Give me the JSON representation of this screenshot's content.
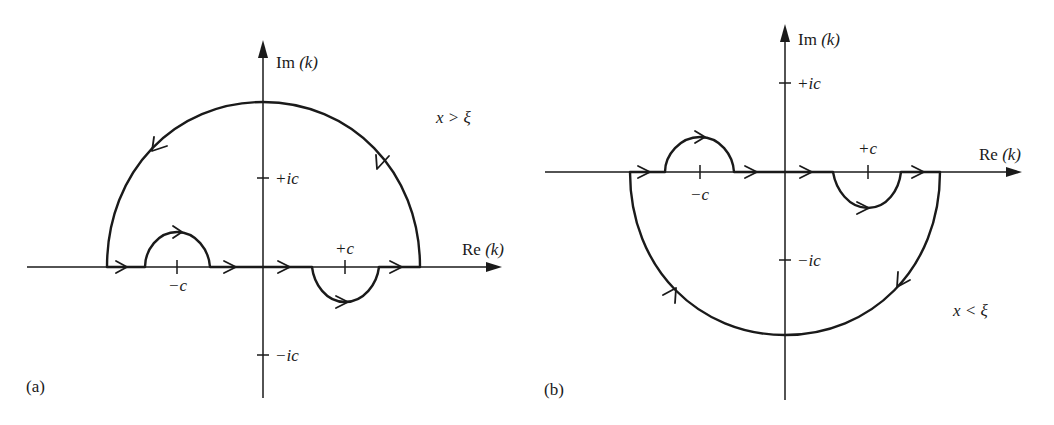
{
  "figure": {
    "panels": [
      {
        "id": "a",
        "label": "(a)",
        "im_axis_label": "Im",
        "im_axis_var": "(k)",
        "re_axis_label": "Re",
        "re_axis_var": "(k)",
        "condition": "x > ξ",
        "tick_plus_ic": "+ic",
        "tick_minus_ic": "−ic",
        "pole_minus_c": "−c",
        "pole_plus_c": "+c",
        "contour_closure": "upper half-plane",
        "indent_minus_c": "above",
        "indent_plus_c": "below"
      },
      {
        "id": "b",
        "label": "(b)",
        "im_axis_label": "Im",
        "im_axis_var": "(k)",
        "re_axis_label": "Re",
        "re_axis_var": "(k)",
        "condition": "x < ξ",
        "tick_plus_ic": "+ic",
        "tick_minus_ic": "−ic",
        "pole_minus_c": "−c",
        "pole_plus_c": "+c",
        "contour_closure": "lower half-plane",
        "indent_minus_c": "above",
        "indent_plus_c": "below"
      }
    ],
    "colors": {
      "ink": "#1a1a1a",
      "background": "#ffffff"
    }
  }
}
